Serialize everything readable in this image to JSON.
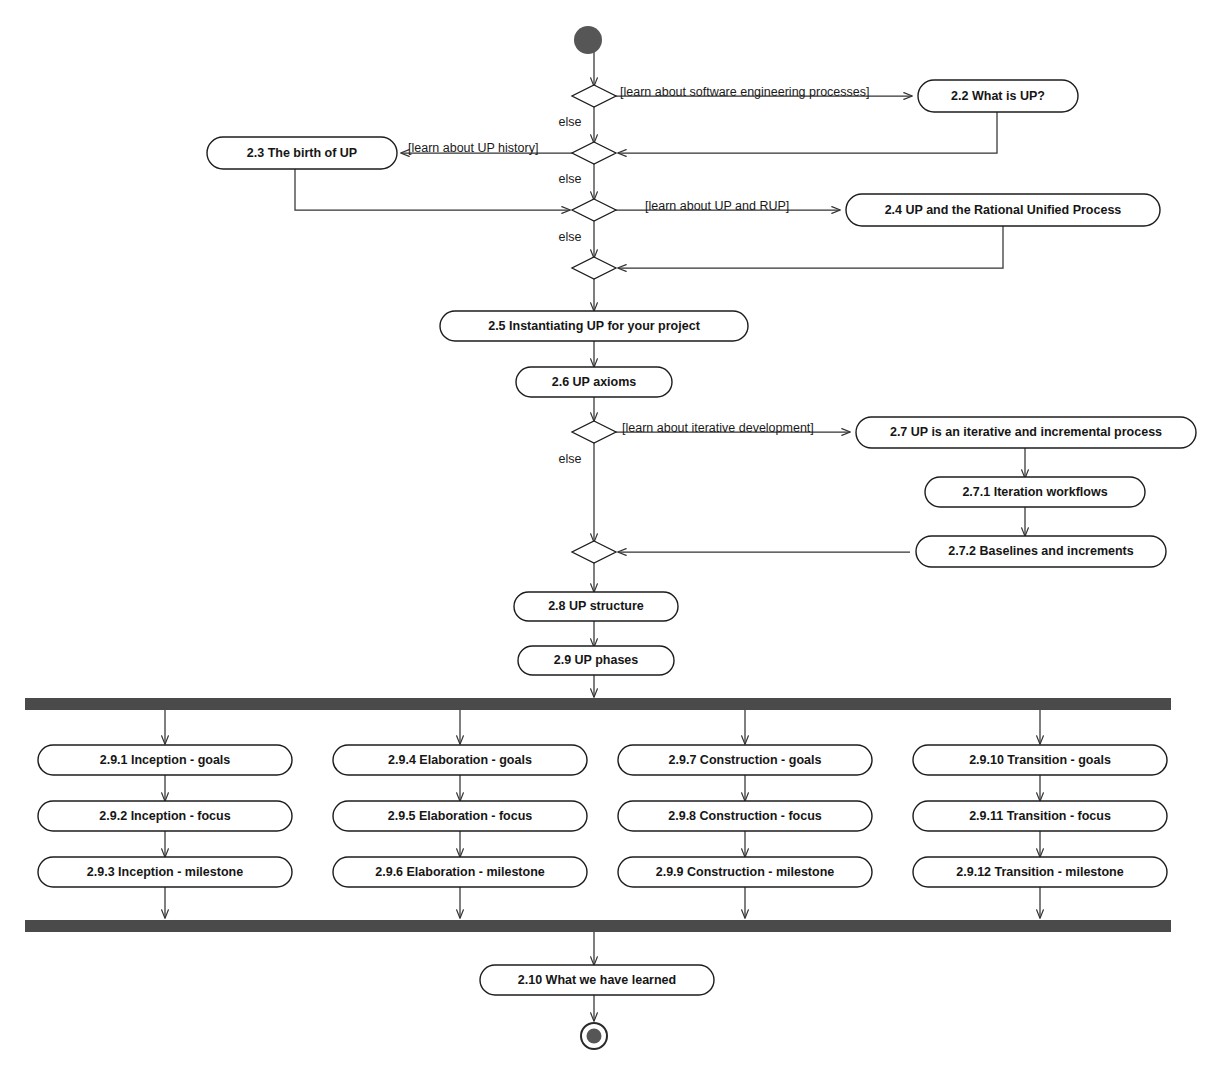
{
  "diagram": {
    "type": "uml-activity-diagram",
    "colors": {
      "node_fill": "#ffffff",
      "node_stroke": "#1c1c1c",
      "line": "#333333",
      "bar": "#4a4a4a",
      "start_node": "#565656",
      "text": "#161616",
      "background": "#ffffff"
    },
    "start_node": {
      "name": "initial-node"
    },
    "end_node": {
      "name": "final-node"
    },
    "decisions": [
      {
        "id": "d1",
        "guard": "[learn about software engineering processes]",
        "else_label": "else"
      },
      {
        "id": "d2",
        "guard": "[learn about UP history]",
        "else_label": "else"
      },
      {
        "id": "d3",
        "guard": "[learn about UP and RUP]",
        "else_label": "else"
      },
      {
        "id": "d4",
        "guard": "",
        "else_label": ""
      },
      {
        "id": "d5",
        "guard": "[learn about iterative development]",
        "else_label": "else"
      },
      {
        "id": "d6",
        "guard": "",
        "else_label": ""
      }
    ],
    "activities": {
      "a22": "2.2 What is UP?",
      "a23": "2.3 The birth of UP",
      "a24": "2.4 UP and the Rational Unified Process",
      "a25": "2.5 Instantiating UP for your project",
      "a26": "2.6 UP axioms",
      "a27": "2.7 UP is an iterative and incremental process",
      "a271": "2.7.1 Iteration workflows",
      "a272": "2.7.2 Baselines and increments",
      "a28": "2.8 UP structure",
      "a29": "2.9 UP phases",
      "a210": "2.10 What we have learned"
    },
    "fork_bar": {
      "name": "fork-bar"
    },
    "join_bar": {
      "name": "join-bar"
    },
    "phase_columns": [
      {
        "name": "inception",
        "items": [
          "2.9.1 Inception - goals",
          "2.9.2 Inception - focus",
          "2.9.3 Inception - milestone"
        ]
      },
      {
        "name": "elaboration",
        "items": [
          "2.9.4 Elaboration - goals",
          "2.9.5 Elaboration - focus",
          "2.9.6 Elaboration - milestone"
        ]
      },
      {
        "name": "construction",
        "items": [
          "2.9.7 Construction - goals",
          "2.9.8 Construction - focus",
          "2.9.9 Construction - milestone"
        ]
      },
      {
        "name": "transition",
        "items": [
          "2.9.10 Transition - goals",
          "2.9.11 Transition - focus",
          "2.9.12 Transition - milestone"
        ]
      }
    ]
  }
}
